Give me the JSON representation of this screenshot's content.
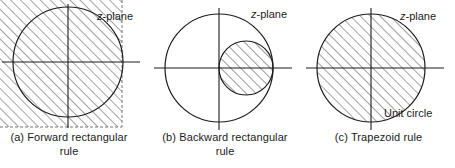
{
  "figure": {
    "background_color": "#ffffff",
    "line_color": "#1c1c1c",
    "hatch_color": "#555555"
  },
  "panels": [
    {
      "id": "a",
      "caption_line1": "(a) Forward rectangular",
      "caption_line2": "rule",
      "z_plane_label": "z",
      "z_plane_suffix": "-plane",
      "unit_circle_label": "",
      "region": "half-plane left of Re(z)=1, fully hatched rectangle with dashed right boundary",
      "circle": {
        "cx": 68,
        "cy": 62,
        "r": 55,
        "hatched": false
      },
      "shaded_rect": {
        "x": 0,
        "y": 0,
        "width": 122,
        "height": 127,
        "dashed_edges": "right,bottom"
      }
    },
    {
      "id": "b",
      "caption_line1": "(b) Backward rectangular",
      "caption_line2": "rule",
      "z_plane_label": "z",
      "z_plane_suffix": "-plane",
      "unit_circle_label": "",
      "region": "small circle of radius 1/2 centered at (1/2, 0), hatched",
      "circle": {
        "cx": 219,
        "cy": 68,
        "r": 54,
        "hatched": false
      },
      "inner_circle": {
        "cx": 246,
        "cy": 68,
        "r": 27,
        "hatched": true
      }
    },
    {
      "id": "c",
      "caption_line1": "(c) Trapezoid rule",
      "caption_line2": "",
      "z_plane_label": "z",
      "z_plane_suffix": "-plane",
      "unit_circle_label": "Unit circle",
      "region": "entire unit disk hatched",
      "circle": {
        "cx": 371,
        "cy": 68,
        "r": 54,
        "hatched": true
      }
    }
  ]
}
